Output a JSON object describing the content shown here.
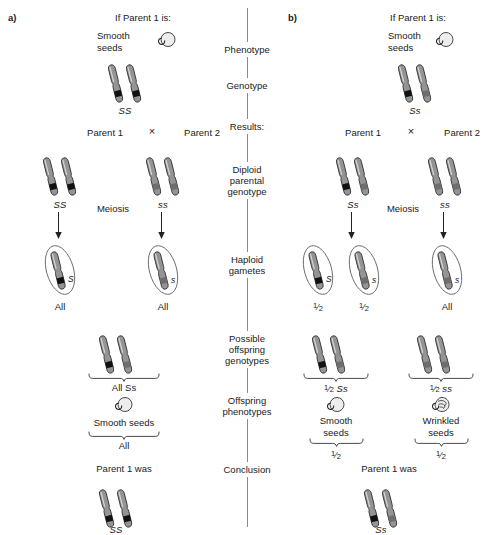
{
  "figure": {
    "panels": [
      {
        "tag": "a)",
        "prompt": "If Parent 1 is:",
        "phenotype_label": "Smooth\nseeds",
        "phenotype_icon": "smooth-seed-icon",
        "genotype": "SS",
        "parent1_label": "Parent 1",
        "cross_symbol": "×",
        "parent2_label": "Parent 2",
        "parent1_genotype": "SS",
        "parent2_genotype": "ss",
        "meiosis_label": "Meiosis",
        "gametes": [
          {
            "allele": "S",
            "proportion": "All",
            "band": "dark"
          },
          {
            "allele": "s",
            "proportion": "All",
            "band": "light"
          }
        ],
        "offspring": [
          {
            "genotype": "All Ss",
            "phenotype": "Smooth seeds",
            "phenotype_icon": "smooth-seed-icon",
            "proportion": "All"
          }
        ],
        "conclusion_label": "Parent 1 was",
        "conclusion_genotype": "SS"
      },
      {
        "tag": "b)",
        "prompt": "If Parent 1 is:",
        "phenotype_label": "Smooth\nseeds",
        "phenotype_icon": "smooth-seed-icon",
        "genotype": "Ss",
        "parent1_label": "Parent 1",
        "cross_symbol": "×",
        "parent2_label": "Parent 2",
        "parent1_genotype": "Ss",
        "parent2_genotype": "ss",
        "meiosis_label": "Meiosis",
        "gametes": [
          {
            "allele": "S",
            "proportion": "1/2",
            "band": "dark"
          },
          {
            "allele": "s",
            "proportion": "1/2",
            "band": "light"
          },
          {
            "allele": "s",
            "proportion": "All",
            "band": "light"
          }
        ],
        "offspring": [
          {
            "genotype": "1/2 Ss",
            "phenotype": "Smooth\nseeds",
            "phenotype_icon": "smooth-seed-icon",
            "proportion": "1/2"
          },
          {
            "genotype": "1/2 ss",
            "phenotype": "Wrinkled\nseeds",
            "phenotype_icon": "wrinkled-seed-icon",
            "proportion": "1/2"
          }
        ],
        "conclusion_label": "Parent 1 was",
        "conclusion_genotype": "Ss"
      }
    ],
    "axis": {
      "steps": [
        "Phenotype",
        "Genotype",
        "Results:",
        "Diploid\nparental\ngenotype",
        "Haploid\ngametes",
        "Possible\noffspring\ngenotypes",
        "Offspring\nphenotypes",
        "Conclusion"
      ]
    },
    "colors": {
      "background": "#ffffff",
      "chromosome_body": "#8f8f8f",
      "chromosome_outline": "#3a3a3a",
      "dominant_band": "#111111",
      "recessive_band": "#777777",
      "axis_line": "#8a8a8a",
      "text": "#1a1a1a",
      "seed_fill": "#ededed"
    },
    "labels": {
      "genotype_a_top": "SS",
      "genotype_b_top": "Ss",
      "a_p1": "SS",
      "a_p2": "ss",
      "b_p1": "Ss",
      "b_p2": "ss",
      "a_gamete_left": "S",
      "a_gamete_right": "s",
      "a_gamete_left_prop": "All",
      "a_gamete_right_prop": "All",
      "b_gamete_1": "S",
      "b_gamete_2": "s",
      "b_gamete_3": "s",
      "b_gamete_1_prop": "1/2",
      "b_gamete_2_prop": "1/2",
      "b_gamete_3_prop": "All",
      "a_offspring_genotype": "All Ss",
      "a_offspring_phenotype": "Smooth seeds",
      "a_offspring_prop": "All",
      "b_offspring_genotype_1": "Ss",
      "b_offspring_genotype_2": "ss",
      "b_offspring_phenotype_1": "Smooth\nseeds",
      "b_offspring_phenotype_2": "Wrinkled\nseeds",
      "a_conclusion": "Parent 1 was",
      "a_conclusion_genotype": "SS",
      "b_conclusion": "Parent 1 was",
      "b_conclusion_genotype": "Ss"
    }
  }
}
